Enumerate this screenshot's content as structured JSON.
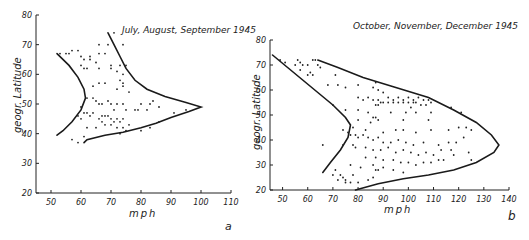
{
  "chart_data": [
    {
      "type": "scatter",
      "panel_label": "a",
      "title": "July,  August, September 1945",
      "xlabel": "mph",
      "ylabel": "geogr. Latitude",
      "xlim": [
        45,
        110
      ],
      "ylim": [
        20,
        80
      ],
      "xticks": [
        50,
        60,
        70,
        80,
        90,
        100,
        110
      ],
      "yticks": [
        20,
        30,
        40,
        50,
        60,
        70,
        80
      ],
      "grid": false,
      "legend": null,
      "envelope_left": [
        [
          52,
          67
        ],
        [
          56,
          63
        ],
        [
          59,
          59
        ],
        [
          61,
          55
        ],
        [
          61.5,
          52
        ],
        [
          60,
          48
        ],
        [
          57,
          44
        ],
        [
          54,
          41
        ],
        [
          52,
          39.5
        ]
      ],
      "envelope_right": [
        [
          69,
          74
        ],
        [
          71,
          70
        ],
        [
          73,
          66
        ],
        [
          75,
          62
        ],
        [
          78,
          58
        ],
        [
          82,
          55
        ],
        [
          88,
          52.5
        ],
        [
          95,
          50.5
        ],
        [
          100,
          49
        ],
        [
          96,
          47.5
        ],
        [
          90,
          45.5
        ],
        [
          85,
          43.5
        ],
        [
          80,
          42
        ],
        [
          74,
          40.5
        ],
        [
          68,
          39.5
        ],
        [
          62,
          38
        ],
        [
          61,
          37
        ]
      ],
      "points": [
        [
          53,
          67
        ],
        [
          55,
          67
        ],
        [
          56,
          67
        ],
        [
          57,
          68
        ],
        [
          59,
          68
        ],
        [
          60,
          66
        ],
        [
          61,
          65
        ],
        [
          63,
          66
        ],
        [
          63,
          65
        ],
        [
          66,
          70
        ],
        [
          69,
          70
        ],
        [
          71,
          74
        ],
        [
          74,
          70
        ],
        [
          66,
          67
        ],
        [
          68,
          67
        ],
        [
          65,
          64
        ],
        [
          70,
          63
        ],
        [
          73,
          63
        ],
        [
          72,
          61
        ],
        [
          75,
          63
        ],
        [
          60,
          63
        ],
        [
          61,
          62
        ],
        [
          62,
          62
        ],
        [
          66,
          62
        ],
        [
          70,
          62
        ],
        [
          74,
          60
        ],
        [
          73,
          58
        ],
        [
          74,
          57
        ],
        [
          66,
          57
        ],
        [
          68,
          57
        ],
        [
          74,
          56
        ],
        [
          72,
          55
        ],
        [
          64,
          56
        ],
        [
          76,
          54
        ],
        [
          62,
          52
        ],
        [
          64,
          52
        ],
        [
          65,
          51
        ],
        [
          66,
          50
        ],
        [
          67,
          50
        ],
        [
          69,
          51
        ],
        [
          70,
          50
        ],
        [
          71,
          48
        ],
        [
          72,
          50
        ],
        [
          74,
          50
        ],
        [
          75,
          48
        ],
        [
          79,
          48
        ],
        [
          82,
          48
        ],
        [
          83,
          50
        ],
        [
          84,
          51
        ],
        [
          86,
          49
        ],
        [
          78,
          48
        ],
        [
          80,
          50
        ],
        [
          60,
          49
        ],
        [
          61,
          47
        ],
        [
          59,
          46
        ],
        [
          60,
          45
        ],
        [
          62,
          47
        ],
        [
          63,
          46
        ],
        [
          64,
          47
        ],
        [
          66,
          45
        ],
        [
          67,
          46
        ],
        [
          68,
          46
        ],
        [
          69,
          46
        ],
        [
          70,
          45
        ],
        [
          71,
          44
        ],
        [
          72,
          45
        ],
        [
          73,
          44
        ],
        [
          74,
          45
        ],
        [
          67,
          44
        ],
        [
          68,
          43
        ],
        [
          70,
          43
        ],
        [
          72,
          42
        ],
        [
          74,
          42
        ],
        [
          76,
          43
        ],
        [
          73,
          40
        ],
        [
          75,
          41
        ],
        [
          80,
          41
        ],
        [
          83,
          42
        ],
        [
          86,
          44
        ],
        [
          91,
          47
        ],
        [
          95,
          48
        ],
        [
          57,
          38
        ],
        [
          59,
          37
        ],
        [
          61,
          39
        ],
        [
          62,
          42
        ],
        [
          65,
          42
        ]
      ]
    },
    {
      "type": "scatter",
      "panel_label": "b",
      "title": "October,  November, December 1945",
      "xlabel": "mph",
      "ylabel": "geogr. Latitude",
      "xlim": [
        45,
        140
      ],
      "ylim": [
        20,
        80
      ],
      "xticks": [
        50,
        60,
        70,
        80,
        90,
        100,
        110,
        120,
        130,
        140
      ],
      "yticks": [
        20,
        30,
        40,
        50,
        60,
        70,
        80
      ],
      "grid": false,
      "legend": null,
      "envelope_left": [
        [
          46,
          74
        ],
        [
          52,
          69
        ],
        [
          58,
          64
        ],
        [
          64,
          59
        ],
        [
          70,
          54
        ],
        [
          75,
          49
        ],
        [
          77,
          46
        ],
        [
          76,
          41
        ],
        [
          73,
          36
        ],
        [
          69,
          31
        ],
        [
          66,
          27
        ]
      ],
      "envelope_right": [
        [
          64,
          72
        ],
        [
          72,
          69
        ],
        [
          82,
          65
        ],
        [
          95,
          61
        ],
        [
          108,
          57
        ],
        [
          118,
          52
        ],
        [
          127,
          47
        ],
        [
          133,
          42
        ],
        [
          136,
          38
        ],
        [
          134,
          35
        ],
        [
          127,
          31
        ],
        [
          118,
          28
        ],
        [
          108,
          26
        ],
        [
          98,
          24.5
        ],
        [
          88,
          22.5
        ],
        [
          79,
          20
        ]
      ],
      "points": [
        [
          49,
          72
        ],
        [
          51,
          71
        ],
        [
          55,
          70
        ],
        [
          56,
          72
        ],
        [
          57,
          71
        ],
        [
          58,
          70
        ],
        [
          60,
          70
        ],
        [
          57,
          68
        ],
        [
          62,
          72
        ],
        [
          63,
          72
        ],
        [
          64,
          70
        ],
        [
          65,
          69
        ],
        [
          61,
          67
        ],
        [
          60,
          66
        ],
        [
          62,
          66
        ],
        [
          71,
          66
        ],
        [
          68,
          62
        ],
        [
          72,
          62
        ],
        [
          75,
          61
        ],
        [
          80,
          62
        ],
        [
          86,
          61
        ],
        [
          87,
          63
        ],
        [
          88,
          60
        ],
        [
          90,
          59
        ],
        [
          92,
          57
        ],
        [
          94,
          56
        ],
        [
          96,
          57
        ],
        [
          98,
          56
        ],
        [
          100,
          57
        ],
        [
          102,
          56
        ],
        [
          104,
          57
        ],
        [
          106,
          56
        ],
        [
          108,
          56
        ],
        [
          80,
          57
        ],
        [
          82,
          56
        ],
        [
          84,
          57
        ],
        [
          86,
          56
        ],
        [
          88,
          56
        ],
        [
          89,
          55
        ],
        [
          90,
          55
        ],
        [
          92,
          55
        ],
        [
          94,
          55
        ],
        [
          96,
          55
        ],
        [
          98,
          55
        ],
        [
          100,
          55
        ],
        [
          102,
          55
        ],
        [
          103,
          55
        ],
        [
          105,
          54
        ],
        [
          107,
          54
        ],
        [
          109,
          55
        ],
        [
          87,
          54
        ],
        [
          88,
          54
        ],
        [
          70,
          54
        ],
        [
          75,
          52
        ],
        [
          80,
          52
        ],
        [
          84,
          51
        ],
        [
          93,
          51
        ],
        [
          99,
          51
        ],
        [
          101,
          53
        ],
        [
          103,
          51
        ],
        [
          109,
          51
        ],
        [
          117,
          53
        ],
        [
          121,
          51
        ],
        [
          86,
          49
        ],
        [
          87,
          49
        ],
        [
          88,
          48
        ],
        [
          98,
          48
        ],
        [
          108,
          48
        ],
        [
          85,
          47
        ],
        [
          80,
          48
        ],
        [
          78,
          45
        ],
        [
          83,
          44
        ],
        [
          90,
          43
        ],
        [
          95,
          44
        ],
        [
          98,
          44
        ],
        [
          103,
          43
        ],
        [
          109,
          44
        ],
        [
          116,
          44
        ],
        [
          120,
          45
        ],
        [
          123,
          45
        ],
        [
          125,
          44
        ],
        [
          74,
          44
        ],
        [
          76,
          43
        ],
        [
          77,
          42
        ],
        [
          79,
          42
        ],
        [
          80,
          41
        ],
        [
          82,
          42
        ],
        [
          84,
          41
        ],
        [
          86,
          40
        ],
        [
          88,
          41
        ],
        [
          90,
          39
        ],
        [
          93,
          39
        ],
        [
          96,
          40
        ],
        [
          99,
          39
        ],
        [
          102,
          38
        ],
        [
          106,
          39
        ],
        [
          112,
          38
        ],
        [
          116,
          39
        ],
        [
          119,
          39
        ],
        [
          122,
          41
        ],
        [
          66,
          38
        ],
        [
          74,
          38
        ],
        [
          78,
          38
        ],
        [
          79,
          37
        ],
        [
          83,
          37
        ],
        [
          86,
          36
        ],
        [
          89,
          36
        ],
        [
          92,
          37
        ],
        [
          95,
          35
        ],
        [
          98,
          36
        ],
        [
          101,
          35
        ],
        [
          104,
          34
        ],
        [
          107,
          35
        ],
        [
          110,
          34
        ],
        [
          113,
          36
        ],
        [
          117,
          36
        ],
        [
          124,
          35
        ],
        [
          125,
          32
        ],
        [
          83,
          33
        ],
        [
          87,
          33
        ],
        [
          90,
          32
        ],
        [
          94,
          32
        ],
        [
          97,
          31
        ],
        [
          100,
          31
        ],
        [
          103,
          30
        ],
        [
          106,
          31
        ],
        [
          109,
          31
        ],
        [
          112,
          32
        ],
        [
          114,
          32
        ],
        [
          118,
          34
        ],
        [
          86,
          30
        ],
        [
          88,
          28
        ],
        [
          90,
          29
        ],
        [
          94,
          28
        ],
        [
          98,
          27
        ],
        [
          77,
          30
        ],
        [
          81,
          29
        ],
        [
          71,
          28
        ],
        [
          70,
          26
        ],
        [
          73,
          26
        ],
        [
          74,
          25
        ],
        [
          75,
          24
        ],
        [
          78,
          26
        ],
        [
          72,
          24
        ],
        [
          75,
          23
        ],
        [
          77,
          23
        ],
        [
          84,
          24
        ],
        [
          86,
          25
        ],
        [
          87,
          28
        ],
        [
          80,
          23
        ]
      ]
    }
  ]
}
